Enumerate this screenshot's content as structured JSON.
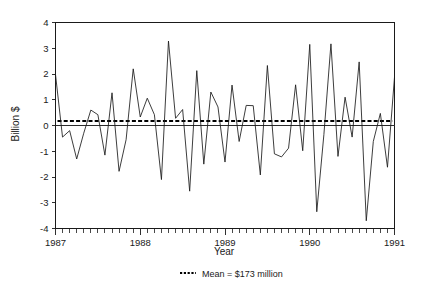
{
  "chart_data": {
    "type": "line",
    "title": "",
    "xlabel": "Year",
    "ylabel": "Billion $",
    "xlim": [
      1987.0,
      1991.0
    ],
    "ylim": [
      -4,
      4
    ],
    "yticks": [
      -4,
      -3,
      -2,
      -1,
      0,
      1,
      2,
      3,
      4
    ],
    "ytick_labels": [
      "-4",
      "-3",
      "-2",
      "-1",
      "0",
      "1",
      "2",
      "3",
      "4"
    ],
    "xticks": [
      1987,
      1988,
      1989,
      1990,
      1991
    ],
    "xtick_labels": [
      "1987",
      "1988",
      "1989",
      "1990",
      "1991"
    ],
    "x_minor_tick_interval_months": 1,
    "grid": false,
    "legend_position": "below-axes",
    "series": [
      {
        "name": "Monthly value",
        "style": "solid",
        "color": "#1a1a1a",
        "x": [
          1987.0,
          1987.083,
          1987.167,
          1987.25,
          1987.333,
          1987.417,
          1987.5,
          1987.583,
          1987.667,
          1987.75,
          1987.833,
          1987.917,
          1988.0,
          1988.083,
          1988.167,
          1988.25,
          1988.333,
          1988.417,
          1988.5,
          1988.583,
          1988.667,
          1988.75,
          1988.833,
          1988.917,
          1989.0,
          1989.083,
          1989.167,
          1989.25,
          1989.333,
          1989.417,
          1989.5,
          1989.583,
          1989.667,
          1989.75,
          1989.833,
          1989.917,
          1990.0,
          1990.083,
          1990.167,
          1990.25,
          1990.333,
          1990.417,
          1990.5,
          1990.583,
          1990.667,
          1990.75,
          1990.833,
          1990.917,
          1991.0
        ],
        "values": [
          1.98,
          -0.45,
          -0.2,
          -1.3,
          -0.3,
          0.6,
          0.42,
          -1.15,
          1.27,
          -1.78,
          -0.55,
          2.2,
          0.33,
          1.06,
          0.42,
          -2.1,
          3.28,
          0.28,
          0.62,
          -2.55,
          2.13,
          -1.5,
          1.3,
          0.72,
          -1.42,
          1.57,
          -0.62,
          0.78,
          0.77,
          -1.92,
          2.33,
          -1.1,
          -1.22,
          -0.88,
          1.58,
          -0.98,
          3.15,
          -3.35,
          -0.35,
          3.17,
          -1.2,
          1.1,
          -0.45,
          2.47,
          -3.7,
          -0.62,
          0.47,
          -1.62,
          1.88
        ]
      },
      {
        "name": "Mean = $173 million",
        "style": "dotted",
        "color": "#000000",
        "constant_value": 0.173
      }
    ],
    "reference_lines": [
      {
        "name": "zero-line",
        "value": 0,
        "style": "solid",
        "color": "#2b2b2b"
      }
    ],
    "legend": [
      {
        "marker": "dotted-line",
        "label": "Mean = $173 million"
      }
    ]
  },
  "axes": {
    "y_title": "Billion $",
    "x_title": "Year"
  }
}
